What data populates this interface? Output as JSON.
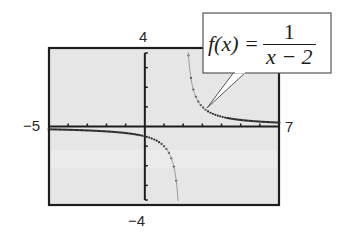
{
  "chart_data": {
    "type": "line",
    "title": "",
    "function": "f(x) = 1/(x - 2)",
    "xlabel": "",
    "ylabel": "",
    "xlim": [
      -5,
      7
    ],
    "ylim": [
      -4,
      4
    ],
    "grid": false,
    "x_tick_labels": {
      "min": "−5",
      "max": "7"
    },
    "y_tick_labels": {
      "max": "4",
      "min": "−4"
    },
    "x_ticks_step": 1,
    "y_ticks_step": 1,
    "vertical_asymptote": 2,
    "horizontal_asymptote": 0,
    "series": [
      {
        "name": "left branch",
        "style": "dotted",
        "x": [
          -5,
          -4,
          -3,
          -2,
          -1,
          0,
          1,
          1.5,
          1.75
        ],
        "y": [
          -0.143,
          -0.167,
          -0.2,
          -0.25,
          -0.333,
          -0.5,
          -1,
          -2,
          -4
        ]
      },
      {
        "name": "right branch",
        "style": "dotted",
        "x": [
          2.25,
          2.5,
          3,
          4,
          5,
          6,
          7
        ],
        "y": [
          4,
          2,
          1,
          0.5,
          0.333,
          0.25,
          0.2
        ]
      }
    ],
    "annotation": {
      "lhs": "f(x) =",
      "numerator": "1",
      "denominator": "x − 2"
    }
  },
  "labels": {
    "x_min": "−5",
    "x_max": "7",
    "y_max": "4",
    "y_min": "−4"
  },
  "callout": {
    "lhs": "f(x) =",
    "numerator": "1",
    "denominator": "x − 2"
  },
  "colors": {
    "frame": "#1e1e1e",
    "screen_bg": "#e6e6e6",
    "curve": "#2a2a2a"
  }
}
